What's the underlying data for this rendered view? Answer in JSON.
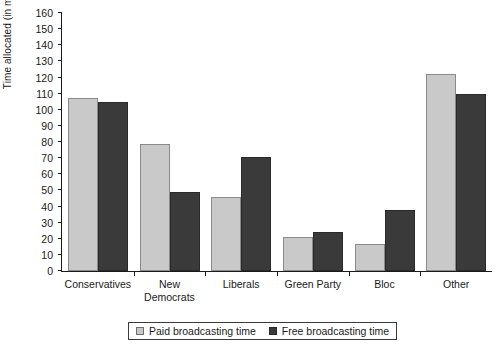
{
  "chart_data": {
    "type": "bar",
    "title": "",
    "xlabel": "",
    "ylabel": "Time allocated (in minutes)",
    "categories": [
      "Conservatives",
      "New Democrats",
      "Liberals",
      "Green Party",
      "Bloc",
      "Other"
    ],
    "category_lines": [
      [
        "Conservatives"
      ],
      [
        "New",
        "Democrats"
      ],
      [
        "Liberals"
      ],
      [
        "Green Party"
      ],
      [
        "Bloc"
      ],
      [
        "Other"
      ]
    ],
    "series": [
      {
        "name": "Paid broadcasting time",
        "color": "#c9c9c9",
        "values": [
          107,
          79,
          46,
          21,
          17,
          122
        ]
      },
      {
        "name": "Free broadcasting time",
        "color": "#3a3a3a",
        "values": [
          105,
          49,
          71,
          24,
          38,
          110
        ]
      }
    ],
    "ylim": [
      0,
      160
    ],
    "ytick_step": 10,
    "yticks": [
      0,
      10,
      20,
      30,
      40,
      50,
      60,
      70,
      80,
      90,
      100,
      110,
      120,
      130,
      140,
      150,
      160
    ],
    "ytick_labels": [
      "0",
      "10",
      "20",
      "30",
      "40",
      "50",
      "60",
      "70",
      "80",
      "90",
      "100",
      "110",
      "120",
      "130",
      "140",
      "150",
      "160"
    ],
    "grid": false,
    "legend_position": "bottom"
  },
  "legend": {
    "items": [
      {
        "label": "Paid broadcasting time",
        "swatch": "paid-swatch-icon"
      },
      {
        "label": "Free broadcasting time",
        "swatch": "free-swatch-icon"
      }
    ]
  }
}
